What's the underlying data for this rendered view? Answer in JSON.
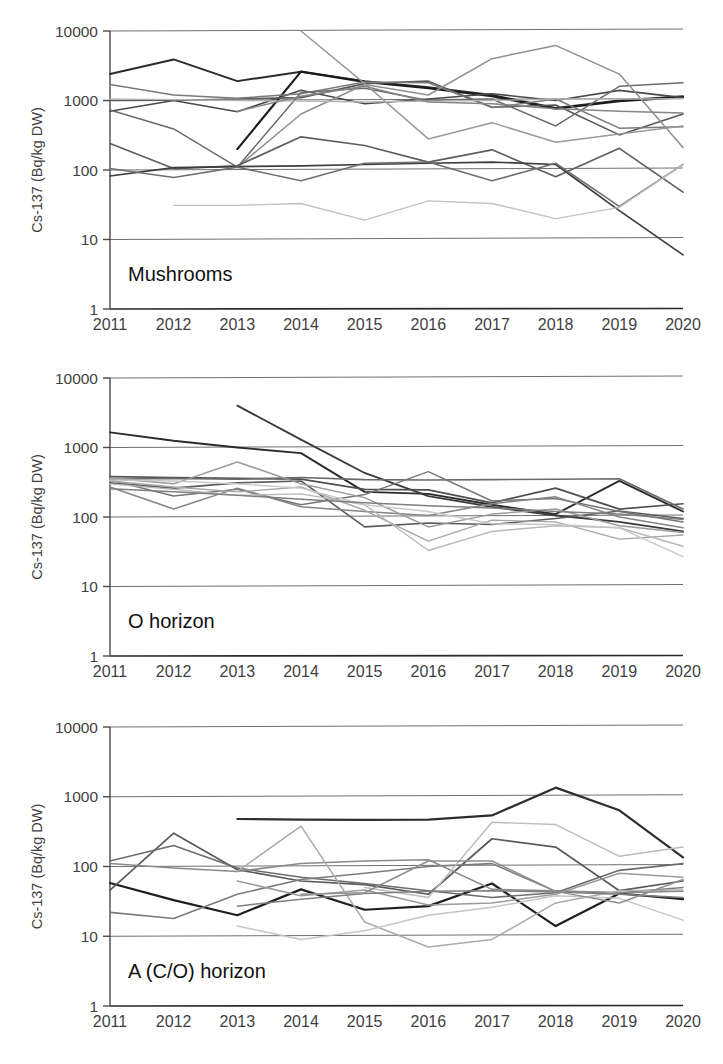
{
  "figure": {
    "y_axis_title": "Cs-137 (Bq/kg DW)",
    "y_ticks": [
      "10000",
      "1000",
      "100",
      "10",
      "1"
    ],
    "x_ticks": [
      "2011",
      "2012",
      "2013",
      "2014",
      "2015",
      "2016",
      "2017",
      "2018",
      "2019",
      "2020"
    ],
    "panel_labels": [
      "Mushrooms",
      "O horizon",
      "A (C/O) horizon"
    ]
  },
  "chart_data": [
    {
      "type": "line",
      "title": "Mushrooms",
      "xlabel": "",
      "ylabel": "Cs-137 (Bq/kg DW)",
      "yscale": "log",
      "ylim": [
        1,
        10000
      ],
      "ytick_values": [
        10000,
        1000,
        100,
        10,
        1
      ],
      "grid": true,
      "legend": "none",
      "x": [
        2011,
        2012,
        2013,
        2014,
        2015,
        2016,
        2017,
        2018,
        2019,
        2020
      ],
      "series": [
        {
          "name": "site-01",
          "color": "#2b2b2b",
          "width": 2.0,
          "values": [
            2400,
            3900,
            1900,
            2600,
            1900,
            1550,
            1200,
            780,
            1000,
            1150
          ]
        },
        {
          "name": "site-02",
          "color": "#1c1c1c",
          "width": 2.2,
          "values": [
            null,
            null,
            200,
            2600,
            1850,
            1500,
            1150,
            760,
            980,
            1120
          ]
        },
        {
          "name": "site-03",
          "color": "#4a4a4a",
          "width": 1.6,
          "values": [
            700,
            1000,
            690,
            1400,
            900,
            1050,
            1250,
            1000,
            1400,
            1100
          ]
        },
        {
          "name": "site-04",
          "color": "#575757",
          "width": 1.6,
          "values": [
            1000,
            1010,
            1050,
            1100,
            1750,
            1900,
            800,
            860,
            320,
            640
          ]
        },
        {
          "name": "site-05",
          "color": "#7a7a7a",
          "width": 1.5,
          "values": [
            1700,
            1200,
            1080,
            1250,
            1850,
            1800,
            790,
            1050,
            400,
            420
          ]
        },
        {
          "name": "site-06",
          "color": "#6b6b6b",
          "width": 1.5,
          "values": [
            730,
            390,
            110,
            1300,
            1500,
            1000,
            1050,
            430,
            1600,
            1800
          ]
        },
        {
          "name": "site-07",
          "color": "#8f8f8f",
          "width": 1.5,
          "values": [
            null,
            null,
            110,
            640,
            1700,
            1200,
            4000,
            6200,
            2400,
            210
          ]
        },
        {
          "name": "site-08",
          "color": "#9a9a9a",
          "width": 1.5,
          "values": [
            null,
            null,
            null,
            10000,
            1750,
            280,
            480,
            250,
            330,
            430
          ]
        },
        {
          "name": "site-09",
          "color": "#5e5e5e",
          "width": 1.7,
          "values": [
            240,
            105,
            115,
            300,
            225,
            130,
            195,
            80,
            205,
            48
          ]
        },
        {
          "name": "site-10",
          "color": "#3d3d3d",
          "width": 1.7,
          "values": [
            82,
            108,
            112,
            115,
            120,
            125,
            130,
            120,
            26,
            6
          ]
        },
        {
          "name": "site-11",
          "color": "#707070",
          "width": 1.6,
          "values": [
            105,
            78,
            110,
            70,
            125,
            130,
            70,
            125,
            30,
            120
          ]
        },
        {
          "name": "site-12",
          "color": "#c2c2c2",
          "width": 1.4,
          "values": [
            null,
            31,
            31,
            33,
            19,
            36,
            33,
            20,
            29,
            120
          ]
        },
        {
          "name": "site-13",
          "color": "#b5b5b5",
          "width": 1.4,
          "values": [
            1050,
            1030,
            1000,
            980,
            950,
            980,
            1000,
            1050,
            1050,
            1060
          ]
        },
        {
          "name": "site-14",
          "color": "#868686",
          "width": 1.5,
          "values": [
            null,
            null,
            700,
            1150,
            1600,
            950,
            900,
            760,
            700,
            660
          ]
        }
      ]
    },
    {
      "type": "line",
      "title": "O horizon",
      "xlabel": "",
      "ylabel": "Cs-137 (Bq/kg DW)",
      "yscale": "log",
      "ylim": [
        1,
        10000
      ],
      "ytick_values": [
        10000,
        1000,
        100,
        10,
        1
      ],
      "grid": true,
      "legend": "none",
      "x": [
        2011,
        2012,
        2013,
        2014,
        2015,
        2016,
        2017,
        2018,
        2019,
        2020
      ],
      "series": [
        {
          "name": "site-01",
          "color": "#2b2b2b",
          "width": 1.9,
          "values": [
            1650,
            1250,
            1000,
            830,
            230,
            215,
            150,
            110,
            330,
            120
          ]
        },
        {
          "name": "site-02",
          "color": "#3a3a3a",
          "width": 1.9,
          "values": [
            null,
            null,
            4000,
            1300,
            430,
            200,
            140,
            105,
            85,
            62
          ]
        },
        {
          "name": "site-03",
          "color": "#4f4f4f",
          "width": 1.7,
          "values": [
            380,
            370,
            360,
            350,
            250,
            245,
            160,
            260,
            130,
            155
          ]
        },
        {
          "name": "site-04",
          "color": "#5c5c5c",
          "width": 1.6,
          "values": [
            310,
            260,
            310,
            330,
            72,
            82,
            78,
            95,
            122,
            95
          ]
        },
        {
          "name": "site-05",
          "color": "#6a6a6a",
          "width": 1.6,
          "values": [
            350,
            360,
            350,
            370,
            345,
            340,
            345,
            350,
            355,
            130
          ]
        },
        {
          "name": "site-06",
          "color": "#767676",
          "width": 1.5,
          "values": [
            340,
            200,
            250,
            150,
            210,
            450,
            170,
            185,
            120,
            85
          ]
        },
        {
          "name": "site-07",
          "color": "#858585",
          "width": 1.5,
          "values": [
            270,
            130,
            260,
            140,
            120,
            105,
            155,
            195,
            100,
            70
          ]
        },
        {
          "name": "site-08",
          "color": "#9a9a9a",
          "width": 1.5,
          "values": [
            360,
            300,
            620,
            300,
            190,
            72,
            110,
            130,
            75,
            60
          ]
        },
        {
          "name": "site-09",
          "color": "#a8a8a8",
          "width": 1.4,
          "values": [
            330,
            270,
            230,
            270,
            125,
            45,
            90,
            85,
            48,
            55
          ]
        },
        {
          "name": "site-10",
          "color": "#b8b8b8",
          "width": 1.4,
          "values": [
            300,
            250,
            205,
            215,
            150,
            33,
            62,
            75,
            70,
            38
          ]
        },
        {
          "name": "site-11",
          "color": "#c8c8c8",
          "width": 1.4,
          "values": [
            340,
            330,
            300,
            260,
            150,
            120,
            80,
            78,
            70,
            27
          ]
        },
        {
          "name": "site-12",
          "color": "#7f7f7f",
          "width": 1.5,
          "values": [
            255,
            230,
            205,
            180,
            160,
            145,
            135,
            120,
            110,
            92
          ]
        }
      ]
    },
    {
      "type": "line",
      "title": "A (C/O) horizon",
      "xlabel": "",
      "ylabel": "Cs-137 (Bq/kg DW)",
      "yscale": "log",
      "ylim": [
        1,
        10000
      ],
      "ytick_values": [
        10000,
        1000,
        100,
        10,
        1
      ],
      "grid": true,
      "legend": "none",
      "x": [
        2011,
        2012,
        2013,
        2014,
        2015,
        2016,
        2017,
        2018,
        2019,
        2020
      ],
      "series": [
        {
          "name": "site-01",
          "color": "#2e2e2e",
          "width": 2.2,
          "values": [
            null,
            null,
            480,
            470,
            465,
            470,
            540,
            1350,
            640,
            135
          ]
        },
        {
          "name": "site-02",
          "color": "#1f1f1f",
          "width": 2.2,
          "values": [
            58,
            33,
            20,
            47,
            24,
            27,
            57,
            14,
            41,
            34
          ]
        },
        {
          "name": "site-03",
          "color": "#5a5a5a",
          "width": 1.7,
          "values": [
            46,
            300,
            90,
            62,
            55,
            40,
            250,
            190,
            45,
            62
          ]
        },
        {
          "name": "site-04",
          "color": "#6c6c6c",
          "width": 1.6,
          "values": [
            120,
            200,
            95,
            70,
            57,
            45,
            36,
            42,
            88,
            110
          ]
        },
        {
          "name": "site-05",
          "color": "#7b7b7b",
          "width": 1.6,
          "values": [
            22,
            18,
            40,
            65,
            80,
            100,
            110,
            44,
            42,
            50
          ]
        },
        {
          "name": "site-06",
          "color": "#8a8a8a",
          "width": 1.5,
          "values": [
            110,
            95,
            85,
            110,
            120,
            125,
            47,
            45,
            42,
            44
          ]
        },
        {
          "name": "site-07",
          "color": "#9b9b9b",
          "width": 1.5,
          "values": [
            null,
            null,
            62,
            38,
            46,
            28,
            30,
            40,
            80,
            70
          ]
        },
        {
          "name": "site-08",
          "color": "#ababab",
          "width": 1.5,
          "values": [
            null,
            null,
            85,
            380,
            16,
            7,
            9,
            30,
            45,
            46
          ]
        },
        {
          "name": "site-09",
          "color": "#bcbcbc",
          "width": 1.4,
          "values": [
            null,
            null,
            null,
            null,
            50,
            36,
            430,
            400,
            140,
            190
          ]
        },
        {
          "name": "site-10",
          "color": "#c5c5c5",
          "width": 1.4,
          "values": [
            null,
            null,
            14,
            9,
            12,
            20,
            26,
            38,
            35,
            17
          ]
        },
        {
          "name": "site-11",
          "color": "#7f7f7f",
          "width": 1.5,
          "values": [
            null,
            null,
            27,
            34,
            41,
            44,
            45,
            43,
            40,
            36
          ]
        },
        {
          "name": "site-12",
          "color": "#8f8f8f",
          "width": 1.5,
          "values": [
            null,
            null,
            null,
            40,
            42,
            120,
            120,
            44,
            30,
            65
          ]
        }
      ]
    }
  ]
}
